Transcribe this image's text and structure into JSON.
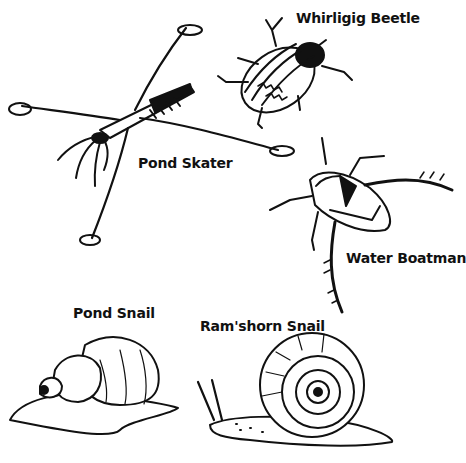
{
  "illustration": {
    "style": "black-and-white ink sketch",
    "colors": {
      "ink": "#111111",
      "paper": "#ffffff"
    },
    "creatures": [
      {
        "id": "whirligig-beetle",
        "label": "Whirligig Beetle"
      },
      {
        "id": "pond-skater",
        "label": "Pond Skater"
      },
      {
        "id": "water-boatman",
        "label": "Water Boatman"
      },
      {
        "id": "pond-snail",
        "label": "Pond Snail"
      },
      {
        "id": "ramshorn-snail",
        "label": "Ram'shorn Snail"
      }
    ]
  }
}
